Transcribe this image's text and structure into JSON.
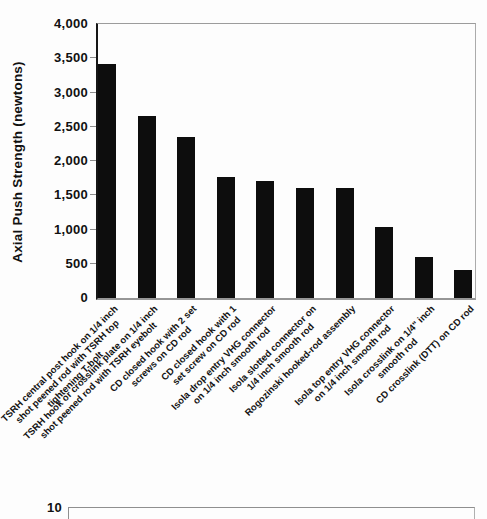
{
  "figure": {
    "background_color": "#fdfdfd",
    "bar_color": "#0d0d0d"
  },
  "chart_data": {
    "type": "bar",
    "title": "",
    "xlabel": "",
    "ylabel": "Axial Push Strength (newtons)",
    "ylim": [
      0,
      4000
    ],
    "ytick_interval": 500,
    "ytick_labels": [
      "4,000",
      "3,500",
      "3,000",
      "2,500",
      "2,000",
      "1,500",
      "1,000",
      "500",
      "0"
    ],
    "grid": false,
    "legend": false,
    "bar_orientation": "vertical",
    "categories": [
      "TSRH central post hook on 1/4 inch shot peened rod with TSRH top tightening T-bolt",
      "TSRH hook or crosslink plate on 1/4 inch shot peened rod with TSRH eyebolt",
      "CD closed hook with 2 set screws on CD rod",
      "CD closed hook with 1 set screw on CD rod",
      "Isola drop entry VHG connector on 1/4 inch smooth rod",
      "Isola slotted connector on 1/4 inch smooth rod",
      "Rogozinski hooked-rod assembly",
      "Isola top entry VHG connector on 1/4 inch smooth rod",
      "Isola crosslink on 1/4\" inch smooth rod",
      "CD crosslink (DTT) on CD rod"
    ],
    "category_label_lines": [
      [
        "TSRH central post hook on 1/4 inch",
        "shot peened rod with TSRH top",
        "tightening T-bolt"
      ],
      [
        "TSRH hook or crosslink plate on 1/4 inch",
        "shot peened rod with TSRH eyebolt"
      ],
      [
        "CD closed hook with 2 set",
        "screws on CD rod"
      ],
      [
        "CD closed hook with 1",
        "set screw on CD rod"
      ],
      [
        "Isola drop entry VHG connector",
        "on 1/4 inch smooth rod"
      ],
      [
        "Isola slotted connector on",
        "1/4 inch smooth rod"
      ],
      [
        "Rogozinski hooked-rod assembly"
      ],
      [
        "Isola top entry VHG connector",
        "on 1/4 inch smooth rod"
      ],
      [
        "Isola crosslink on 1/4\" inch",
        "smooth rod"
      ],
      [
        "CD crosslink (DTT) on CD rod"
      ]
    ],
    "values": [
      3420,
      2660,
      2350,
      1760,
      1710,
      1600,
      1600,
      1040,
      600,
      410
    ]
  },
  "next_chart_fragment": {
    "visible_tick_label": "10"
  }
}
